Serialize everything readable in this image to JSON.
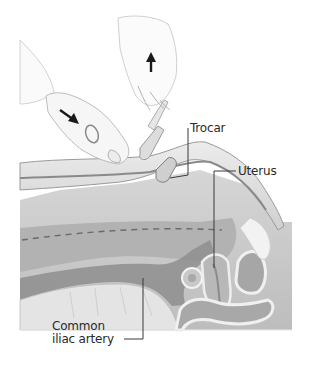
{
  "figure": {
    "labels": {
      "trocar": "Trocar",
      "uterus": "Uterus",
      "iliac_line1": "Common",
      "iliac_line2": "iliac artery"
    },
    "arrows": [
      {
        "name": "down-right-arrow",
        "direction": "down-right",
        "hand": "left"
      },
      {
        "name": "up-arrow",
        "direction": "up",
        "hand": "right"
      }
    ],
    "colors": {
      "background": "#ffffff",
      "skin_outline": "#9a9a9a",
      "abdomen_fill": "#c4c4c4",
      "cavity_fill": "#b0b0b0",
      "vessel_fill": "#8e8e8e",
      "spine_fill": "#e2e2e2",
      "label_text": "#2a2a2a",
      "leader_line": "#3a3a3a",
      "arrow": "#1a1a1a"
    }
  }
}
